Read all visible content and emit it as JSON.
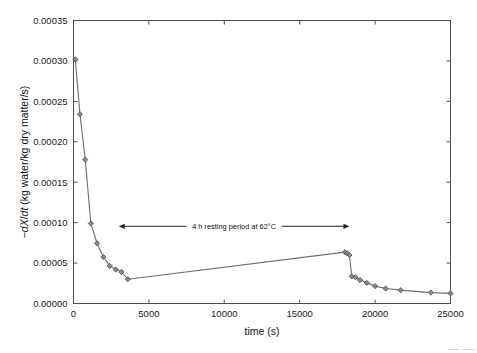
{
  "figure": {
    "background_color": "#ffffff",
    "line_color": "#6e6e6e",
    "marker_fill": "#8a8a8a",
    "marker_edge": "#4a4a4a",
    "axis_color": "#4d4d4d"
  },
  "annotation": {
    "text": "4 h resting period at 62°C",
    "x_start": 3000,
    "x_end": 18300,
    "y": 9.55e-05,
    "arrow_style": "double-headed"
  },
  "axes": {
    "x_title": "time (s)",
    "y_title": "−dX/dt (kg water/kg dry matter/s)",
    "x_ticklabels": [
      "0",
      "5000",
      "10000",
      "15000",
      "20000",
      "25000"
    ],
    "y_ticklabels": [
      "0.00000",
      "0.00005",
      "0.00010",
      "0.00015",
      "0.00020",
      "0.00025",
      "0.00030",
      "0.00035"
    ]
  },
  "corner_artifact": "—— ——",
  "chart_data": {
    "type": "line",
    "title": "",
    "subtitle": "",
    "xlabel": "time (s)",
    "ylabel": "−dX/dt (kg water/kg dry matter/s)",
    "xlim": [
      0,
      25000
    ],
    "ylim": [
      0.0,
      0.00035
    ],
    "xticks": [
      0,
      5000,
      10000,
      15000,
      20000,
      25000
    ],
    "yticks": [
      0.0,
      5e-05,
      0.0001,
      0.00015,
      0.0002,
      0.00025,
      0.0003,
      0.00035
    ],
    "grid": false,
    "legend": false,
    "legend_position": "none",
    "marker": "diamond",
    "annotations": [
      {
        "text": "4 h resting period at 62°C",
        "x_start": 3000,
        "x_end": 18300,
        "y": 9.55e-05,
        "type": "double-arrow"
      }
    ],
    "series": [
      {
        "name": "drying rate",
        "x": [
          120,
          430,
          780,
          1150,
          1560,
          1980,
          2400,
          2800,
          3180,
          3600,
          18000,
          18150,
          18300,
          18450,
          18700,
          19000,
          19450,
          20000,
          20700,
          21700,
          23700,
          25000
        ],
        "y": [
          0.000302,
          0.000234,
          0.000178,
          9.9e-05,
          7.45e-05,
          5.75e-05,
          4.65e-05,
          4.2e-05,
          3.9e-05,
          3e-05,
          6.35e-05,
          6.2e-05,
          6e-05,
          3.35e-05,
          3.25e-05,
          2.9e-05,
          2.55e-05,
          2.15e-05,
          1.85e-05,
          1.65e-05,
          1.35e-05,
          1.25e-05
        ]
      }
    ]
  }
}
